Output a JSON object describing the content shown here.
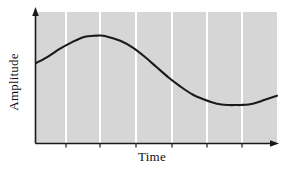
{
  "figure": {
    "background": "#ffffff",
    "plot_background": "#d6d6d6",
    "gridline_color": "#ffffff",
    "axis_color": "#1a1a1a",
    "curve_color": "#1a1a1a"
  },
  "labels": {
    "ylabel": "Amplitude",
    "xlabel": "Time"
  },
  "chart_data": {
    "type": "line",
    "title": "",
    "xlabel": "Time",
    "ylabel": "Amplitude",
    "xlim": [
      0,
      1
    ],
    "ylim": [
      0,
      1
    ],
    "grid": true,
    "grid_orientation": "vertical",
    "gridline_count": 6,
    "gridline_x": [
      0.124,
      0.266,
      0.415,
      0.564,
      0.71,
      0.855
    ],
    "legend": false,
    "axis_ticks_x": [
      0.124,
      0.266,
      0.415,
      0.564,
      0.71,
      0.855
    ],
    "axis_tick_labels_x": [],
    "axis_tick_labels_y": [],
    "arrowheads": [
      "x-right",
      "y-top"
    ],
    "series": [
      {
        "name": "waveform",
        "description": "smooth sinusoidal amplitude-versus-time waveform",
        "x": [
          0.0,
          0.05,
          0.1,
          0.15,
          0.2,
          0.25,
          0.27,
          0.3,
          0.35,
          0.4,
          0.45,
          0.5,
          0.55,
          0.6,
          0.65,
          0.7,
          0.75,
          0.8,
          0.83,
          0.85,
          0.9,
          0.95,
          1.0
        ],
        "y": [
          0.61,
          0.66,
          0.72,
          0.77,
          0.81,
          0.82,
          0.82,
          0.81,
          0.78,
          0.73,
          0.66,
          0.58,
          0.5,
          0.43,
          0.37,
          0.33,
          0.3,
          0.29,
          0.29,
          0.29,
          0.3,
          0.33,
          0.36
        ]
      }
    ]
  }
}
